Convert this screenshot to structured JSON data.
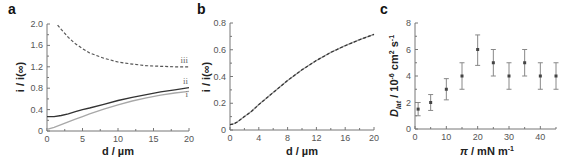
{
  "chart_data": [
    {
      "panel": "a",
      "type": "line",
      "title": "",
      "xlabel": "d / µm",
      "ylabel": "i / i(∞)",
      "xlim": [
        0,
        20
      ],
      "ylim": [
        0,
        2.0
      ],
      "xticks": [
        0,
        5,
        10,
        15,
        20
      ],
      "xtick_labels": [
        "0",
        "5",
        "10",
        "15",
        "20"
      ],
      "yticks": [
        0,
        0.4,
        0.8,
        1.2,
        1.6,
        2.0
      ],
      "ytick_labels": [
        "0",
        "0.4",
        "0.8",
        "1.2",
        "1.6",
        "2.0"
      ],
      "grid": false,
      "series": [
        {
          "name": "i",
          "style": "solid",
          "color": "#a8a8a8",
          "x": [
            0,
            1,
            2,
            3,
            4,
            5,
            6,
            8,
            10,
            12,
            14,
            16,
            18,
            20
          ],
          "y": [
            0.03,
            0.07,
            0.12,
            0.17,
            0.22,
            0.27,
            0.32,
            0.41,
            0.49,
            0.56,
            0.62,
            0.67,
            0.71,
            0.74
          ]
        },
        {
          "name": "ii",
          "style": "solid",
          "color": "#333333",
          "x": [
            0,
            1,
            2,
            3,
            4,
            5,
            6,
            8,
            10,
            12,
            14,
            16,
            18,
            20
          ],
          "y": [
            0.27,
            0.27,
            0.29,
            0.32,
            0.36,
            0.4,
            0.43,
            0.5,
            0.57,
            0.63,
            0.68,
            0.73,
            0.77,
            0.81
          ]
        },
        {
          "name": "iii",
          "style": "dashed",
          "color": "#555555",
          "x": [
            1.5,
            2,
            3,
            4,
            5,
            6,
            8,
            10,
            12,
            14,
            16,
            18,
            20
          ],
          "y": [
            1.98,
            1.9,
            1.75,
            1.63,
            1.54,
            1.46,
            1.36,
            1.29,
            1.25,
            1.22,
            1.21,
            1.2,
            1.2
          ]
        }
      ],
      "annotations": [
        "i",
        "ii",
        "iii"
      ]
    },
    {
      "panel": "b",
      "type": "line",
      "title": "",
      "xlabel": "d / µm",
      "ylabel": "i / i(∞)",
      "xlim": [
        0,
        20
      ],
      "ylim": [
        0,
        0.8
      ],
      "xticks": [
        0,
        4,
        8,
        12,
        16,
        20
      ],
      "xtick_labels": [
        "0",
        "4",
        "8",
        "12",
        "16",
        "20"
      ],
      "yticks": [
        0,
        0.2,
        0.4,
        0.6,
        0.8
      ],
      "ytick_labels": [
        "0",
        "0.2",
        "0.4",
        "0.6",
        "0.8"
      ],
      "grid": false,
      "series": [
        {
          "name": "theory",
          "style": "solid",
          "color": "#9a9a9a",
          "x": [
            0,
            0.5,
            1,
            2,
            3,
            4,
            5,
            6,
            8,
            10,
            12,
            14,
            16,
            18,
            20
          ],
          "y": [
            0.04,
            0.045,
            0.06,
            0.1,
            0.14,
            0.19,
            0.235,
            0.28,
            0.37,
            0.45,
            0.52,
            0.58,
            0.63,
            0.675,
            0.715
          ]
        },
        {
          "name": "fit",
          "style": "dashed",
          "color": "#333333",
          "x": [
            0,
            0.5,
            1,
            2,
            3,
            4,
            5,
            6,
            8,
            10,
            12,
            14,
            16,
            18,
            20
          ],
          "y": [
            0.04,
            0.045,
            0.06,
            0.1,
            0.14,
            0.19,
            0.235,
            0.28,
            0.37,
            0.45,
            0.52,
            0.58,
            0.63,
            0.675,
            0.715
          ]
        }
      ]
    },
    {
      "panel": "c",
      "type": "scatter",
      "title": "",
      "xlabel": "π / mN m⁻¹",
      "ylabel": "D_lat / 10⁻⁶ cm² s⁻¹",
      "xlim": [
        0,
        45
      ],
      "ylim": [
        0,
        8
      ],
      "xticks": [
        0,
        10,
        20,
        30,
        40
      ],
      "xtick_labels": [
        "0",
        "10",
        "20",
        "30",
        "40"
      ],
      "yticks": [
        0,
        2,
        4,
        6,
        8
      ],
      "ytick_labels": [
        "0",
        "2",
        "4",
        "6",
        "8"
      ],
      "grid": false,
      "series": [
        {
          "name": "D_lat",
          "marker": "square",
          "color": "#444444",
          "x": [
            1,
            5,
            10,
            15,
            20,
            25,
            30,
            35,
            40,
            45
          ],
          "y": [
            1.5,
            2.0,
            3.0,
            4.0,
            6.0,
            5.0,
            4.0,
            5.0,
            4.0,
            4.0
          ],
          "err_low": [
            0.5,
            0.6,
            0.8,
            1.0,
            1.2,
            1.0,
            1.0,
            1.0,
            1.0,
            1.0
          ],
          "err_high": [
            0.5,
            0.6,
            0.8,
            1.0,
            1.1,
            1.0,
            1.0,
            1.0,
            1.0,
            1.0
          ]
        }
      ]
    }
  ],
  "labels": {
    "panel_a": "a",
    "panel_b": "b",
    "panel_c": "c",
    "a_xlabel": "d / µm",
    "a_ylabel": "i / i(∞)",
    "b_xlabel": "d / µm",
    "b_ylabel": "i / i(∞)",
    "c_xlabel_main": "π",
    "c_xlabel_rest": " / mN m",
    "c_xlabel_sup": "-1",
    "c_ylabel_D": "D",
    "c_ylabel_sub": "lat",
    "c_ylabel_mid": " / 10",
    "c_ylabel_sup1": "-6",
    "c_ylabel_cm": " cm",
    "c_ylabel_sup2": "2",
    "c_ylabel_s": " s",
    "c_ylabel_sup3": "-1"
  }
}
